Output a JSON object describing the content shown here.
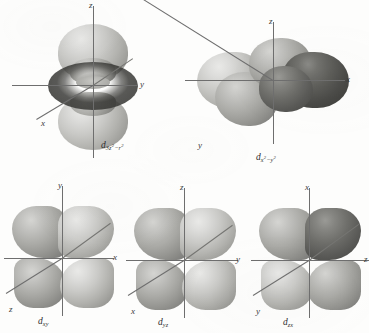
{
  "figure": {
    "kind": "d-orbital angular distribution plates",
    "background_color": "#fdfdfc",
    "axis_color": "#6e6e6e",
    "lobe_light_color": "#c9c9c6",
    "lobe_dark_color": "#4a4a47"
  },
  "orbitals": [
    {
      "id": "dz2",
      "label_base": "d",
      "label_sub": "3z",
      "label_sub_sup1": "2",
      "label_sub_mid": "−r",
      "label_sub_sup2": "2",
      "label_plain": "d3z²−r²",
      "axes": [
        {
          "name": "z",
          "direction": "up"
        },
        {
          "name": "y",
          "direction": "right"
        },
        {
          "name": "x",
          "direction": "lower-left"
        }
      ],
      "shape": "two lobes along z with a torus in the xy plane"
    },
    {
      "id": "dx2-y2",
      "label_base": "d",
      "label_sub": "x",
      "label_sub_sup1": "2",
      "label_sub_mid": "−y",
      "label_sub_sup2": "2",
      "label_plain": "dx²−y²",
      "axes": [
        {
          "name": "z",
          "direction": "up"
        },
        {
          "name": "x",
          "direction": "right"
        },
        {
          "name": "y",
          "direction": "lower-left"
        }
      ],
      "shape": "four lobes along x and y"
    },
    {
      "id": "dxy",
      "label_base": "d",
      "label_sub": "xy",
      "label_plain": "dxy",
      "axes": [
        {
          "name": "y",
          "direction": "up"
        },
        {
          "name": "x",
          "direction": "right"
        },
        {
          "name": "z",
          "direction": "lower-left"
        }
      ],
      "shape": "four lobes between x and y axes"
    },
    {
      "id": "dyz",
      "label_base": "d",
      "label_sub": "yz",
      "label_plain": "dyz",
      "axes": [
        {
          "name": "z",
          "direction": "up"
        },
        {
          "name": "y",
          "direction": "right"
        },
        {
          "name": "x",
          "direction": "lower-left"
        }
      ],
      "shape": "four lobes between y and z axes"
    },
    {
      "id": "dzx",
      "label_base": "d",
      "label_sub": "zx",
      "label_plain": "dzx",
      "axes": [
        {
          "name": "x",
          "direction": "up"
        },
        {
          "name": "z",
          "direction": "right"
        },
        {
          "name": "y",
          "direction": "lower-left"
        }
      ],
      "shape": "four lobes between z and x axes"
    }
  ]
}
